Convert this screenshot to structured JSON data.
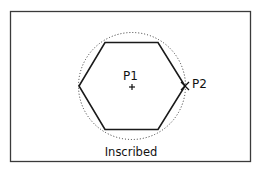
{
  "diagram": {
    "caption": "Inscribed",
    "center_label": "P1",
    "center_marker": "+",
    "radius_point_label": "P2",
    "radius_point_marker": "x-mark",
    "shape": "hexagon",
    "reference": "dotted-circle",
    "colors": {
      "line": "#1a1a1a",
      "frame": "#3a3a3a",
      "background": "#ffffff"
    }
  }
}
